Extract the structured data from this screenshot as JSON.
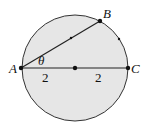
{
  "diagram": {
    "type": "circle-geometry",
    "circle": {
      "cx": 75,
      "cy": 68,
      "r": 53,
      "fill": "#e6e6e6",
      "stroke": "#333333"
    },
    "points": {
      "A": {
        "label": "A",
        "x": 21,
        "y": 68
      },
      "B": {
        "label": "B",
        "x": 100,
        "y": 21
      },
      "C": {
        "label": "C",
        "x": 128,
        "y": 68
      },
      "center": {
        "x": 75,
        "y": 68
      }
    },
    "angle_label": "θ",
    "segment_labels": {
      "left": "2",
      "right": "2"
    }
  }
}
